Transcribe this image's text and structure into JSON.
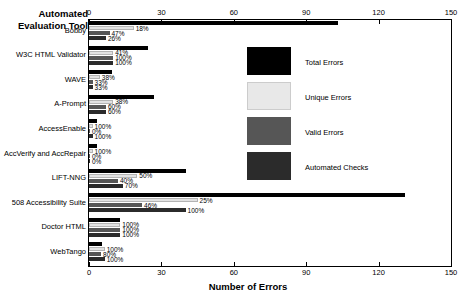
{
  "chart_data": {
    "type": "bar",
    "orientation": "horizontal",
    "title": "",
    "xlabel": "Number of Errors",
    "ylabel": "Automated Evaluation Tool",
    "xlim": [
      0,
      150
    ],
    "xticks": [
      0,
      30,
      60,
      90,
      120,
      150
    ],
    "grid": false,
    "dual_axis": true,
    "legend_position": "inside-right",
    "categories": [
      "Bobby",
      "W3C HTML Validator",
      "WAVE",
      "A-Prompt",
      "AccessEnable",
      "AccVerify and AccRepair",
      "LIFT-NNG",
      "508 Accessibility Suite",
      "Doctor HTML",
      "WebTango"
    ],
    "series": [
      {
        "name": "Total Errors",
        "color": "#000000",
        "values": [
          103,
          24.5,
          9.5,
          27,
          3.5,
          3.5,
          40,
          131,
          13,
          5.5
        ],
        "labels": [
          "",
          "",
          "",
          "",
          "",
          "",
          "",
          "",
          "",
          ""
        ]
      },
      {
        "name": "Unique Errors",
        "color": "#e8e8e8",
        "values": [
          18.5,
          10,
          4.5,
          10,
          1.5,
          1.5,
          20,
          45,
          13,
          6.5
        ],
        "labels": [
          "18%",
          "41%",
          "38%",
          "38%",
          "100%",
          "100%",
          "50%",
          "25%",
          "100%",
          "100%"
        ]
      },
      {
        "name": "Valid Errors",
        "color": "#565656",
        "values": [
          8.5,
          10,
          1.5,
          7,
          0,
          0,
          12,
          22,
          13,
          5
        ],
        "labels": [
          "47%",
          "100%",
          "33%",
          "60%",
          "0%",
          "0%",
          "40%",
          "46%",
          "100%",
          "80%"
        ]
      },
      {
        "name": "Automated Checks",
        "color": "#2b2b2b",
        "values": [
          7,
          10,
          1.5,
          7,
          1.5,
          0,
          14,
          40,
          13,
          6.5
        ],
        "labels": [
          "26%",
          "100%",
          "33%",
          "60%",
          "100%",
          "0%",
          "70%",
          "100%",
          "100%",
          "100%"
        ]
      }
    ]
  },
  "legend": {
    "items": [
      {
        "label": "Total Errors"
      },
      {
        "label": "Unique Errors"
      },
      {
        "label": "Valid Errors"
      },
      {
        "label": "Automated Checks"
      }
    ]
  },
  "axis": {
    "y_title": "Automated Evaluation Tool",
    "x_title": "Number of Errors",
    "tick_labels": [
      "0",
      "30",
      "60",
      "90",
      "120",
      "150"
    ]
  }
}
